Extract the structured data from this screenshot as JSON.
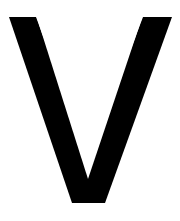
{
  "image": {
    "kind": "letter-glyph",
    "glyph_character": "V",
    "description": "Large black capital letter V on a plain white background",
    "width_px": 180,
    "height_px": 221,
    "background_color": "#ffffff",
    "glyph_color": "#000000",
    "orientation": "upright"
  },
  "geometry": {
    "outline_label": "capital-V-outline",
    "outer_top_left_x": 9,
    "outer_top_left_y": 17,
    "left_stroke_top_right_x": 36,
    "right_stroke_top_left_x": 143,
    "outer_top_right_x": 172,
    "outer_top_right_y": 17,
    "baseline_y": 203,
    "baseline_left_x": 72,
    "baseline_right_x": 105,
    "inner_apex_x": 88,
    "inner_apex_y": 179,
    "left_stroke_width_at_midheight": 31,
    "right_stroke_width_at_midheight": 30,
    "points": "9,17 36,17 88,179 88,179 143,17 172,17 105,203 72,203"
  },
  "accessibility": {
    "alt_text": "The capital letter V rendered in solid black",
    "caption": "V"
  }
}
